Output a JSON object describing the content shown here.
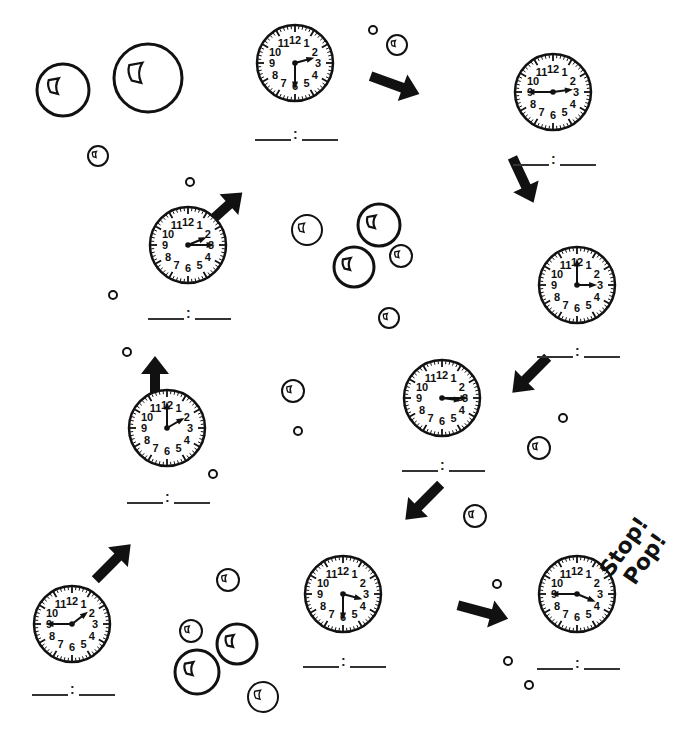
{
  "worksheet": {
    "stop_text_1": "Stop!",
    "stop_text_2": "Pop!",
    "ink_color": "#111111",
    "background": "#ffffff"
  },
  "clocks": [
    {
      "id": "clock-1",
      "cx": 72,
      "cy": 624,
      "r": 38,
      "hour": 1,
      "minute": 45,
      "answer_blank": "___ : ___",
      "blank_y": 694
    },
    {
      "id": "clock-2",
      "cx": 167,
      "cy": 428,
      "r": 38,
      "hour": 2,
      "minute": 0,
      "answer_blank": "___ : ___",
      "blank_y": 502
    },
    {
      "id": "clock-3",
      "cx": 188,
      "cy": 245,
      "r": 38,
      "hour": 2,
      "minute": 15,
      "answer_blank": "___ : ___",
      "blank_y": 318
    },
    {
      "id": "clock-4",
      "cx": 295,
      "cy": 63,
      "r": 38,
      "hour": 2,
      "minute": 30,
      "answer_blank": "___ : ___",
      "blank_y": 139
    },
    {
      "id": "clock-5",
      "cx": 553,
      "cy": 92,
      "r": 38,
      "hour": 2,
      "minute": 45,
      "answer_blank": "___ : ___",
      "blank_y": 164
    },
    {
      "id": "clock-6",
      "cx": 577,
      "cy": 285,
      "r": 38,
      "hour": 3,
      "minute": 0,
      "answer_blank": "___ : ___",
      "blank_y": 356
    },
    {
      "id": "clock-7",
      "cx": 442,
      "cy": 398,
      "r": 38,
      "hour": 3,
      "minute": 15,
      "answer_blank": "___ : ___",
      "blank_y": 470
    },
    {
      "id": "clock-8",
      "cx": 343,
      "cy": 594,
      "r": 38,
      "hour": 3,
      "minute": 30,
      "answer_blank": "___ : ___",
      "blank_y": 666
    },
    {
      "id": "clock-9",
      "cx": 577,
      "cy": 594,
      "r": 38,
      "hour": 3,
      "minute": 45,
      "answer_blank": "___ : ___",
      "blank_y": 668
    }
  ],
  "clock_numbers": [
    "12",
    "1",
    "2",
    "3",
    "4",
    "5",
    "6",
    "7",
    "8",
    "9",
    "10",
    "11"
  ],
  "arrows": [
    {
      "id": "arrow-1-2",
      "x": 113,
      "y": 562,
      "angle": -45,
      "len": 50
    },
    {
      "id": "arrow-2-3",
      "x": 155,
      "y": 382,
      "angle": -90,
      "len": 52
    },
    {
      "id": "arrow-3-4",
      "x": 223,
      "y": 210,
      "angle": -42,
      "len": 52
    },
    {
      "id": "arrow-4-5",
      "x": 395,
      "y": 85,
      "angle": 20,
      "len": 52
    },
    {
      "id": "arrow-5-6",
      "x": 523,
      "y": 180,
      "angle": 65,
      "len": 50
    },
    {
      "id": "arrow-6-7",
      "x": 530,
      "y": 375,
      "angle": 135,
      "len": 50
    },
    {
      "id": "arrow-7-8",
      "x": 423,
      "y": 502,
      "angle": 135,
      "len": 50
    },
    {
      "id": "arrow-8-9",
      "x": 483,
      "y": 612,
      "angle": 15,
      "len": 52
    }
  ],
  "bubbles": [
    {
      "cx": 63,
      "cy": 90,
      "r": 26,
      "hl": true
    },
    {
      "cx": 148,
      "cy": 78,
      "r": 34,
      "hl": true
    },
    {
      "cx": 98,
      "cy": 156,
      "r": 10,
      "hl": true
    },
    {
      "cx": 373,
      "cy": 30,
      "r": 4,
      "hl": false
    },
    {
      "cx": 397,
      "cy": 45,
      "r": 10,
      "hl": true
    },
    {
      "cx": 190,
      "cy": 182,
      "r": 4,
      "hl": false
    },
    {
      "cx": 307,
      "cy": 230,
      "r": 15,
      "hl": true
    },
    {
      "cx": 379,
      "cy": 225,
      "r": 21,
      "hl": true
    },
    {
      "cx": 354,
      "cy": 267,
      "r": 20,
      "hl": true
    },
    {
      "cx": 401,
      "cy": 256,
      "r": 11,
      "hl": true
    },
    {
      "cx": 389,
      "cy": 318,
      "r": 10,
      "hl": true
    },
    {
      "cx": 113,
      "cy": 295,
      "r": 4,
      "hl": false
    },
    {
      "cx": 127,
      "cy": 352,
      "r": 4,
      "hl": false
    },
    {
      "cx": 293,
      "cy": 391,
      "r": 11,
      "hl": true
    },
    {
      "cx": 298,
      "cy": 431,
      "r": 4,
      "hl": false
    },
    {
      "cx": 213,
      "cy": 474,
      "r": 4,
      "hl": false
    },
    {
      "cx": 563,
      "cy": 418,
      "r": 4,
      "hl": false
    },
    {
      "cx": 539,
      "cy": 448,
      "r": 11,
      "hl": true
    },
    {
      "cx": 475,
      "cy": 516,
      "r": 11,
      "hl": true
    },
    {
      "cx": 228,
      "cy": 580,
      "r": 11,
      "hl": true
    },
    {
      "cx": 191,
      "cy": 631,
      "r": 11,
      "hl": true
    },
    {
      "cx": 237,
      "cy": 644,
      "r": 20,
      "hl": true
    },
    {
      "cx": 197,
      "cy": 672,
      "r": 22,
      "hl": true
    },
    {
      "cx": 263,
      "cy": 697,
      "r": 15,
      "hl": true
    },
    {
      "cx": 497,
      "cy": 584,
      "r": 4,
      "hl": false
    },
    {
      "cx": 508,
      "cy": 661,
      "r": 4,
      "hl": false
    },
    {
      "cx": 529,
      "cy": 685,
      "r": 4,
      "hl": false
    }
  ]
}
